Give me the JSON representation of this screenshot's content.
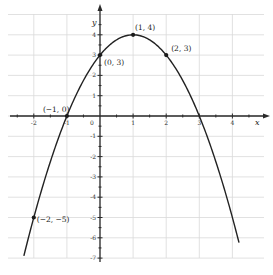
{
  "chart_data": {
    "type": "line",
    "title": "",
    "function": "y = -x^2 + 2x + 3",
    "xlabel": "x",
    "ylabel": "y",
    "xlim": [
      -2.7,
      4.9
    ],
    "ylim": [
      -7,
      5
    ],
    "grid": true,
    "x_ticks": [
      -2,
      -1,
      0,
      1,
      2,
      3,
      4
    ],
    "x_tick_labels": [
      "-2",
      "-1",
      "0",
      "1",
      "2",
      "3",
      "4"
    ],
    "y_ticks": [
      -7,
      -6,
      -5,
      -4,
      -3,
      -2,
      -1,
      1,
      2,
      3,
      4
    ],
    "y_tick_labels": [
      "-7",
      "-6",
      "-5",
      "-4",
      "-3",
      "-2",
      "-1",
      "1",
      "2",
      "3",
      "4"
    ],
    "series": [
      {
        "name": "parabola",
        "x": [
          -2.3,
          -2,
          -1,
          0,
          1,
          2,
          3,
          4.2
        ],
        "y": [
          -6.89,
          -5,
          0,
          3,
          4,
          3,
          0,
          -6.24
        ]
      }
    ],
    "labeled_points": [
      {
        "x": -1,
        "y": 0,
        "label": "(−1, 0)"
      },
      {
        "x": 0,
        "y": 3,
        "label": "(0, 3)"
      },
      {
        "x": 1,
        "y": 4,
        "label": "(1, 4)"
      },
      {
        "x": 2,
        "y": 3,
        "label": "(2, 3)"
      },
      {
        "x": -2,
        "y": -5,
        "label": "(−2, −5)"
      }
    ],
    "colors": {
      "curve": "#222222",
      "grid": "#d9d9d9",
      "axis": "#2a2a2a"
    }
  }
}
